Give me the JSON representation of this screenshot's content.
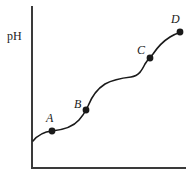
{
  "figure": {
    "background": "#ffffff",
    "ink": "#1a1a1a",
    "width": 195,
    "height": 179
  },
  "axes": {
    "y_label": "pH",
    "x_label": "",
    "origin": {
      "x": 32,
      "y": 168
    },
    "y_top": {
      "x": 32,
      "y": 7
    },
    "x_right": {
      "x": 185,
      "y": 168
    },
    "ticks": "none",
    "grid": "off",
    "axis_color": "#3a3a3a"
  },
  "chart_data": {
    "type": "line",
    "title": "",
    "xlabel": "",
    "ylabel": "pH",
    "grid": false,
    "legend": "none",
    "axis_ticks": "none",
    "curve_color": "#1a1a1a",
    "curve_width": 1.6,
    "series": [
      {
        "name": "pH curve",
        "x": [
          33,
          40,
          47,
          52,
          60,
          70,
          80,
          86,
          92,
          100,
          108,
          118,
          128,
          138,
          144,
          150,
          156,
          163,
          170,
          177,
          181
        ],
        "y": [
          140,
          135,
          132,
          131,
          130,
          128,
          120,
          110,
          98,
          88,
          81,
          78,
          77,
          72,
          65,
          58,
          50,
          42,
          36,
          33,
          32
        ],
        "note": "y values are pixel coordinates measured from the top of the figure; smaller y means higher pH"
      }
    ],
    "points": [
      {
        "label": "A",
        "x": 52,
        "y": 131,
        "label_x": 46,
        "label_y": 112,
        "role": "first-buffer-midpoint"
      },
      {
        "label": "B",
        "x": 86,
        "y": 110,
        "label_x": 74,
        "label_y": 98,
        "role": "first-equivalence-point"
      },
      {
        "label": "C",
        "x": 150,
        "y": 58,
        "label_x": 137,
        "label_y": 44,
        "role": "second-buffer-midpoint"
      },
      {
        "label": "D",
        "x": 180,
        "y": 32,
        "label_x": 171,
        "label_y": 13,
        "role": "second-equivalence-point"
      }
    ],
    "point_marker": {
      "shape": "filled-circle",
      "radius": 3.4,
      "color": "#1a1a1a"
    }
  }
}
